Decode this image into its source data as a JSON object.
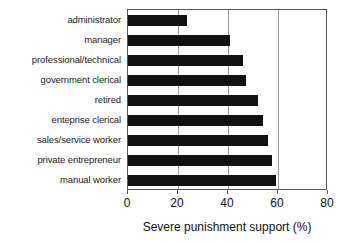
{
  "chart_data": {
    "type": "bar",
    "orientation": "horizontal",
    "title": "",
    "xlabel": "Severe punishment support (%)",
    "ylabel": "",
    "xlim": [
      0,
      80
    ],
    "xticks": [
      0,
      20,
      40,
      60,
      80
    ],
    "grid": true,
    "grid_axis": "x",
    "legend": false,
    "bar_color": "#111111",
    "categories": [
      "administrator",
      "manager",
      "professional/technical",
      "government clerical",
      "retired",
      "enteprise clerical",
      "sales/service worker",
      "private entrepreneur",
      "manual worker"
    ],
    "values": [
      23.5,
      41,
      46,
      47,
      52,
      54,
      56,
      57.5,
      59
    ]
  }
}
